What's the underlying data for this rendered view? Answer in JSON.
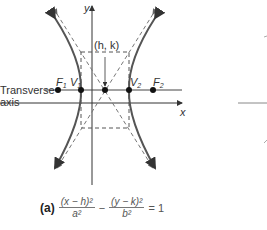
{
  "diagram": {
    "axis_labels": {
      "x": "x",
      "y": "y"
    },
    "center_label": "(h, k)",
    "transverse_axis_label": [
      "Transverse",
      "axis"
    ],
    "points": [
      {
        "name": "F",
        "sub": "1"
      },
      {
        "name": "V",
        "sub": "1"
      },
      {
        "name": "V",
        "sub": "2"
      },
      {
        "name": "F",
        "sub": "2"
      }
    ],
    "colors": {
      "curve": "#555555",
      "axes": "#333333",
      "dashed": "#666666"
    }
  },
  "equation": {
    "part": "(a)",
    "term1_num": "(x − h)²",
    "term1_den": "a²",
    "minus": "−",
    "term2_num": "(y − k)²",
    "term2_den": "b²",
    "rhs": "= 1"
  }
}
